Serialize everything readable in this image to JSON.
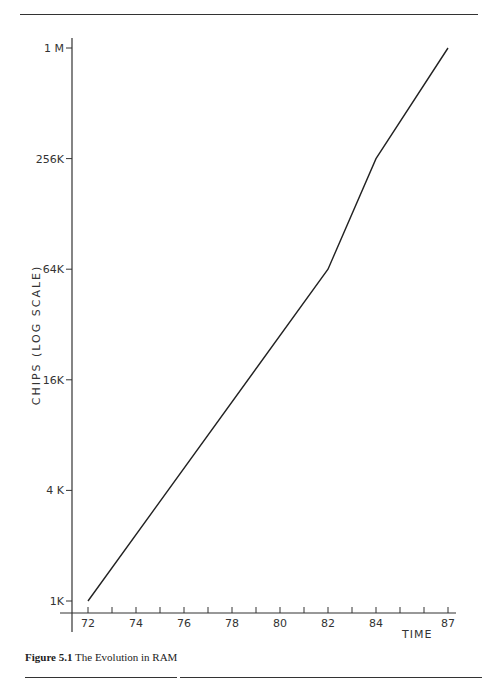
{
  "caption": {
    "label": "Figure 5.1",
    "text": "The Evolution in RAM"
  },
  "chart_data": {
    "type": "line",
    "title": "The Evolution in RAM",
    "xlabel": "TIME",
    "ylabel": "CHIPS (LOG SCALE)",
    "x_tick_labels": [
      "72",
      "74",
      "76",
      "78",
      "80",
      "82",
      "84",
      "87"
    ],
    "y_tick_labels": [
      "1K",
      "4 K",
      "16K",
      "64K",
      "256K",
      "1 M"
    ],
    "y_scale": "log",
    "ylim": [
      1024,
      1048576
    ],
    "xlim": [
      71,
      87
    ],
    "grid": false,
    "series": [
      {
        "name": "RAM chip capacity",
        "x": [
          72,
          82,
          84,
          87
        ],
        "y": [
          1024,
          65536,
          262144,
          1048576
        ],
        "y_labels": [
          "1K",
          "64K",
          "256K",
          "1M"
        ]
      }
    ]
  }
}
